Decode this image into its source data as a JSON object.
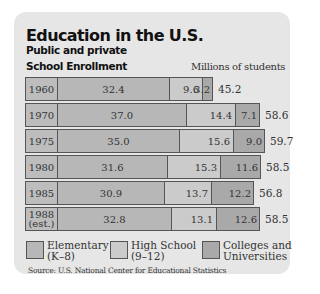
{
  "header": {
    "title": "Education in the U.S.",
    "subtitle": "Public and private",
    "section": "School Enrollment",
    "units": "Millions of students"
  },
  "rows": [
    {
      "year": "1960",
      "elementary": "32.4",
      "high_school": "9.6",
      "colleges": "3.2",
      "total": "45.2"
    },
    {
      "year": "1970",
      "elementary": "37.0",
      "high_school": "14.4",
      "colleges": "7.1",
      "total": "58.6"
    },
    {
      "year": "1975",
      "elementary": "35.0",
      "high_school": "15.6",
      "colleges": "9.0",
      "total": "59.7"
    },
    {
      "year": "1980",
      "elementary": "31.6",
      "high_school": "15.3",
      "colleges": "11.6",
      "total": "58.5"
    },
    {
      "year": "1985",
      "elementary": "30.9",
      "high_school": "13.7",
      "colleges": "12.2",
      "total": "56.8"
    },
    {
      "year": "1988 (est.)",
      "year_line1": "1988",
      "year_line2": "(est.)",
      "elementary": "32.8",
      "high_school": "13.1",
      "colleges": "12.6",
      "total": "58.5"
    }
  ],
  "legend": [
    {
      "line1": "Elementary",
      "line2": "(K–8)",
      "color": "#b7b7b7"
    },
    {
      "line1": "High School",
      "line2": "(9–12)",
      "color": "#cbcbcb"
    },
    {
      "line1": "Colleges and",
      "line2": "Universities",
      "color": "#a9a9a9"
    }
  ],
  "source": "Source: U.S. National Center for Educational Statistics",
  "chart_data": {
    "type": "bar",
    "stacked": true,
    "orientation": "horizontal",
    "title": "Education in the U.S.",
    "subtitle": "Public and private — School Enrollment",
    "xlabel": "Millions of students",
    "ylabel": "",
    "categories": [
      "1960",
      "1970",
      "1975",
      "1980",
      "1985",
      "1988 (est.)"
    ],
    "series": [
      {
        "name": "Elementary (K–8)",
        "values": [
          32.4,
          37.0,
          35.0,
          31.6,
          30.9,
          32.8
        ]
      },
      {
        "name": "High School (9–12)",
        "values": [
          9.6,
          14.4,
          15.6,
          15.3,
          13.7,
          13.1
        ]
      },
      {
        "name": "Colleges and Universities",
        "values": [
          3.2,
          7.1,
          9.0,
          11.6,
          12.2,
          12.6
        ]
      }
    ],
    "totals": [
      45.2,
      58.6,
      59.7,
      58.5,
      56.8,
      58.5
    ],
    "legend_position": "bottom",
    "grid": false,
    "source": "Source: U.S. National Center for Educational Statistics"
  }
}
